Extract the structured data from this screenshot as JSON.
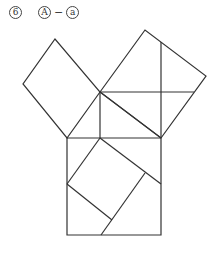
{
  "problem": {
    "number": "6",
    "answer_left": "A",
    "dash": "−",
    "answer_right": "a"
  },
  "diagram": {
    "type": "Pythagorean theorem dissection",
    "shapes": [
      "left square",
      "right square",
      "hypotenuse square",
      "inner tilted square"
    ]
  }
}
